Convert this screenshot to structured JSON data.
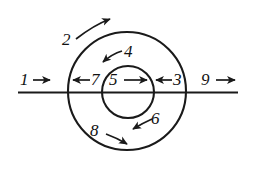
{
  "figure": {
    "background_color": "#ffffff",
    "stroke_color": "#1a1a1a",
    "width": 253,
    "height": 180
  },
  "shapes": {
    "outer_circle": {
      "name": "outer-circle",
      "cx": 127,
      "cy": 91,
      "r": 59
    },
    "inner_circle": {
      "name": "inner-circle",
      "cx": 128,
      "cy": 92,
      "r": 26
    },
    "horizontal_line": {
      "name": "horizontal-axis-line",
      "x1": 18,
      "y1": 92,
      "x2": 238,
      "y2": 92
    }
  },
  "labels": {
    "one": {
      "text": "1",
      "x": 20,
      "y": 74,
      "arrow": "right"
    },
    "two": {
      "text": "2",
      "x": 62,
      "y": 32,
      "arrow": "curved-up-right"
    },
    "three": {
      "text": "3",
      "x": 173,
      "y": 74,
      "arrow": "left"
    },
    "four": {
      "text": "4",
      "x": 124,
      "y": 44,
      "arrow": "down-left"
    },
    "five": {
      "text": "5",
      "x": 109,
      "y": 74,
      "arrow": "right"
    },
    "six": {
      "text": "6",
      "x": 151,
      "y": 112,
      "arrow": "down-left"
    },
    "seven": {
      "text": "7",
      "x": 91,
      "y": 74,
      "arrow": "left"
    },
    "eight": {
      "text": "8",
      "x": 90,
      "y": 124,
      "arrow": "right-down"
    },
    "nine": {
      "text": "9",
      "x": 201,
      "y": 74,
      "arrow": "right"
    }
  },
  "arrow_names": [
    "arrow-1-right",
    "arrow-2-curved-counterclockwise",
    "arrow-3-inward-left",
    "arrow-4-inward-down-left",
    "arrow-5-right",
    "arrow-6-inward-down-left",
    "arrow-7-outward-left",
    "arrow-8-outward-right-down",
    "arrow-9-right"
  ]
}
